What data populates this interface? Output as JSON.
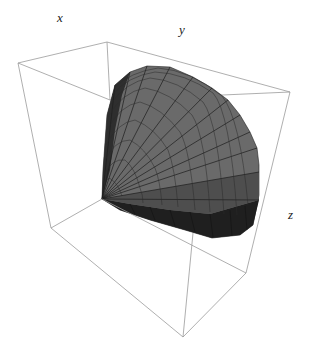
{
  "figure": {
    "type": "3d-surface-plot",
    "axes": {
      "x": {
        "label": "x"
      },
      "y": {
        "label": "y"
      },
      "z": {
        "label": "z"
      }
    },
    "surface": {
      "shape": "cone",
      "mesh": true,
      "colors": {
        "light_face": "#6e6e6e",
        "mid_face": "#5a5a5a",
        "dark_face": "#2a2a2a",
        "darkest_face": "#1a1a1a",
        "mesh_line": "#1e1e1e"
      }
    },
    "box": {
      "visible": true,
      "color": "#8c8c8c"
    }
  }
}
